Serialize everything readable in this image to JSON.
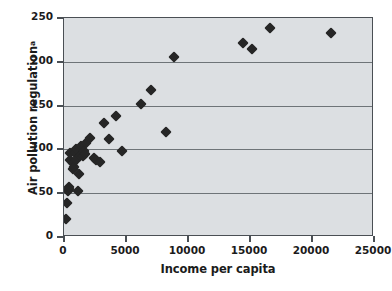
{
  "chart_data": {
    "type": "scatter",
    "title": "",
    "xlabel": "Income per capita",
    "ylabel": "Air pollution regulation",
    "ylabel_superscript": "a",
    "xlim": [
      0,
      25000
    ],
    "ylim": [
      0,
      250
    ],
    "xticks": [
      0,
      5000,
      10000,
      15000,
      20000,
      25000
    ],
    "yticks": [
      0,
      50,
      100,
      150,
      200,
      250
    ],
    "xtick_labels": [
      "0",
      "5000",
      "10000",
      "15000",
      "20000",
      "25000"
    ],
    "ytick_labels": [
      "0",
      "50",
      "100",
      "150",
      "200",
      "250"
    ],
    "grid": "horizontal",
    "legend": null,
    "marker": "diamond",
    "marker_color": "#262626",
    "plot_background": "#dcdfe2",
    "series": [
      {
        "name": "Countries",
        "points": [
          [
            150,
            21
          ],
          [
            250,
            39
          ],
          [
            320,
            53
          ],
          [
            400,
            55
          ],
          [
            430,
            57
          ],
          [
            480,
            88
          ],
          [
            520,
            96
          ],
          [
            700,
            78
          ],
          [
            760,
            84
          ],
          [
            820,
            80
          ],
          [
            900,
            96
          ],
          [
            950,
            100
          ],
          [
            1000,
            88
          ],
          [
            1100,
            53
          ],
          [
            1200,
            72
          ],
          [
            1300,
            92
          ],
          [
            1400,
            104
          ],
          [
            1500,
            93
          ],
          [
            1600,
            98
          ],
          [
            1700,
            95
          ],
          [
            1750,
            107
          ],
          [
            2100,
            113
          ],
          [
            2400,
            90
          ],
          [
            2600,
            88
          ],
          [
            2900,
            86
          ],
          [
            3200,
            130
          ],
          [
            3600,
            112
          ],
          [
            4200,
            138
          ],
          [
            4700,
            98
          ],
          [
            6200,
            152
          ],
          [
            7000,
            168
          ],
          [
            8200,
            120
          ],
          [
            8900,
            205
          ],
          [
            14400,
            221
          ],
          [
            15200,
            215
          ],
          [
            16600,
            239
          ],
          [
            21500,
            233
          ]
        ]
      }
    ]
  },
  "axes": {
    "y_title": "Air pollution regulation",
    "y_title_sup": "a",
    "x_title": "Income per capita"
  }
}
